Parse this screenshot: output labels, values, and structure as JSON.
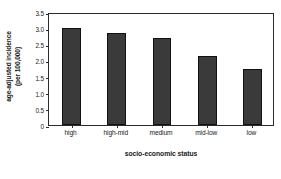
{
  "chart_data": {
    "type": "bar",
    "title": "",
    "categories": [
      "high",
      "high-mid",
      "medium",
      "mid-low",
      "low"
    ],
    "values": [
      3.0,
      2.85,
      2.68,
      2.15,
      1.72
    ],
    "series": [
      {
        "name": "age-adjusted incidence (per 100,000)",
        "values": [
          3.0,
          2.85,
          2.68,
          2.15,
          1.72
        ]
      }
    ],
    "xlabel": "socio-economic status",
    "ylabel_line1": "age-adjusted incidence",
    "ylabel_line2": "(per 100,000)",
    "ylabel": "age-adjusted incidence (per 100,000)",
    "ylim": [
      0,
      3.5
    ],
    "yticks": [
      0,
      0.5,
      1.0,
      1.5,
      2.0,
      2.5,
      3.0,
      3.5
    ],
    "ytick_labels": [
      "0",
      "0.5",
      "1.0",
      "1.5",
      "2.0",
      "2.5",
      "3.0",
      "3.5"
    ],
    "grid": false,
    "legend": false,
    "bar_color": "#3a3a3a",
    "bar_edge_color": "#121212",
    "axis_color": "#2b2b2b",
    "background": "#ffffff"
  }
}
